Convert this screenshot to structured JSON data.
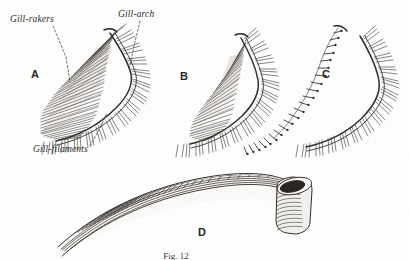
{
  "figure": {
    "title_caption": "Fig. 12",
    "background_color": "#ffffff",
    "ink_color": "#2e2a26",
    "labels": [
      {
        "id": "gill-rakers",
        "text": "Gill-rakers",
        "x": 10,
        "y": 22
      },
      {
        "id": "gill-arch",
        "text": "Gill-arch",
        "x": 118,
        "y": 17
      },
      {
        "id": "gill-filaments",
        "text": "Gill-filaments",
        "x": 33,
        "y": 152
      }
    ],
    "leaders": [
      {
        "id": "leader-gill-rakers",
        "path": "M 53 26 L 66 57 L 70 82"
      },
      {
        "id": "leader-gill-arch",
        "path": "M 140 21 L 134 46 L 129 70"
      },
      {
        "id": "leader-gill-filaments",
        "path": "M 90 146 L 100 128 L 107 113"
      }
    ],
    "specimens": [
      {
        "id": "specimen-a",
        "letter": "A",
        "letter_x": 31,
        "letter_y": 78,
        "raker_type": "dense-fine-comb",
        "raker_count": 58,
        "filament_count": 72,
        "description": "Gill arch with very numerous fine closely-set gill-rakers, plankton-feeder type"
      },
      {
        "id": "specimen-b",
        "letter": "B",
        "letter_x": 180,
        "letter_y": 80,
        "raker_type": "moderate-slender",
        "raker_count": 40,
        "filament_count": 66,
        "description": "Gill arch with moderately numerous slender gill-rakers"
      },
      {
        "id": "specimen-c",
        "letter": "C",
        "letter_x": 322,
        "letter_y": 78,
        "raker_type": "sparse-knobby",
        "raker_count": 22,
        "filament_count": 60,
        "description": "Gill arch with few short knob-like gill-rakers, predatory type"
      },
      {
        "id": "specimen-d",
        "letter": "D",
        "letter_x": 198,
        "letter_y": 236,
        "raker_type": "none",
        "raker_count": 0,
        "filament_count": 46,
        "description": "Detached gill arch seen edgewise with rolled cylindrical end"
      }
    ]
  }
}
